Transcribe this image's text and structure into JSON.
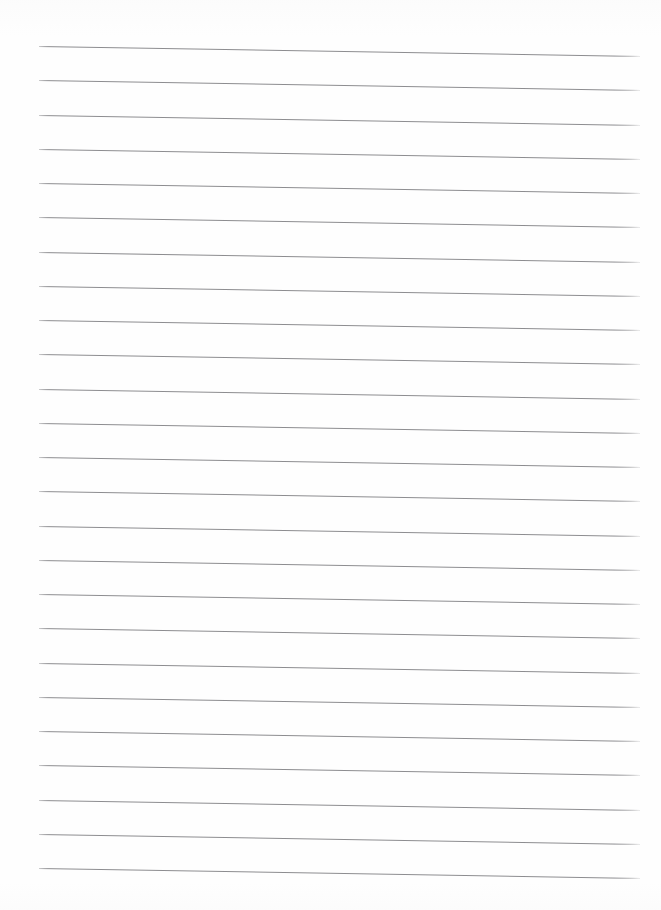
{
  "document": {
    "kind": "lined-paper-scan",
    "title": "",
    "text_content": "",
    "page_width": 661,
    "page_height": 910,
    "background_color": "#ffffff",
    "paper_color": "#fefefe"
  },
  "ruling": {
    "line_color": "#8d8d90",
    "line_thickness_px": 1,
    "line_count": 25,
    "line_spacing_px": 34.3,
    "left_margin_px": 39,
    "right_end_px": 640,
    "first_line_y_px": 46,
    "last_line_y_px": 868,
    "skew_degrees": 0.95,
    "skew_drop_px": 10,
    "margin_rule": "none",
    "header_rule": "none",
    "holes": "none",
    "lines": [
      {
        "index": 1,
        "y_left": 46,
        "y_right": 56
      },
      {
        "index": 2,
        "y_left": 80,
        "y_right": 90
      },
      {
        "index": 3,
        "y_left": 115,
        "y_right": 125
      },
      {
        "index": 4,
        "y_left": 149,
        "y_right": 159
      },
      {
        "index": 5,
        "y_left": 183,
        "y_right": 193
      },
      {
        "index": 6,
        "y_left": 217,
        "y_right": 227
      },
      {
        "index": 7,
        "y_left": 252,
        "y_right": 262
      },
      {
        "index": 8,
        "y_left": 286,
        "y_right": 296
      },
      {
        "index": 9,
        "y_left": 320,
        "y_right": 330
      },
      {
        "index": 10,
        "y_left": 354,
        "y_right": 364
      },
      {
        "index": 11,
        "y_left": 389,
        "y_right": 399
      },
      {
        "index": 12,
        "y_left": 423,
        "y_right": 433
      },
      {
        "index": 13,
        "y_left": 457,
        "y_right": 467
      },
      {
        "index": 14,
        "y_left": 491,
        "y_right": 501
      },
      {
        "index": 15,
        "y_left": 526,
        "y_right": 536
      },
      {
        "index": 16,
        "y_left": 560,
        "y_right": 570
      },
      {
        "index": 17,
        "y_left": 594,
        "y_right": 604
      },
      {
        "index": 18,
        "y_left": 628,
        "y_right": 638
      },
      {
        "index": 19,
        "y_left": 663,
        "y_right": 673
      },
      {
        "index": 20,
        "y_left": 697,
        "y_right": 707
      },
      {
        "index": 21,
        "y_left": 731,
        "y_right": 741
      },
      {
        "index": 22,
        "y_left": 765,
        "y_right": 775
      },
      {
        "index": 23,
        "y_left": 800,
        "y_right": 810
      },
      {
        "index": 24,
        "y_left": 834,
        "y_right": 844
      },
      {
        "index": 25,
        "y_left": 868,
        "y_right": 878
      }
    ]
  }
}
